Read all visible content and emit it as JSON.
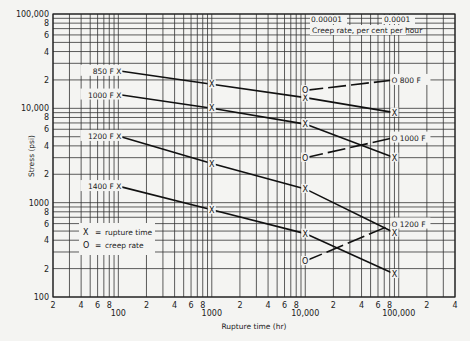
{
  "chart_data": {
    "type": "line",
    "title": "",
    "xlabel": "Rupture time (hr)",
    "ylabel": "Stress (psi)",
    "xscale": "log",
    "yscale": "log",
    "xlim": [
      20,
      400000
    ],
    "ylim": [
      100,
      100000
    ],
    "grid": true,
    "x_tick_labels": [
      {
        "value": 20,
        "label": "2"
      },
      {
        "value": 40,
        "label": "4"
      },
      {
        "value": 60,
        "label": "6"
      },
      {
        "value": 80,
        "label": "8"
      },
      {
        "value": 100,
        "label": "100",
        "major": true
      },
      {
        "value": 200,
        "label": "2"
      },
      {
        "value": 400,
        "label": "4"
      },
      {
        "value": 600,
        "label": "6"
      },
      {
        "value": 800,
        "label": "8"
      },
      {
        "value": 1000,
        "label": "1000",
        "major": true
      },
      {
        "value": 2000,
        "label": "2"
      },
      {
        "value": 4000,
        "label": "4"
      },
      {
        "value": 6000,
        "label": "6"
      },
      {
        "value": 8000,
        "label": "8"
      },
      {
        "value": 10000,
        "label": "10,000",
        "major": true
      },
      {
        "value": 20000,
        "label": "2"
      },
      {
        "value": 40000,
        "label": "4"
      },
      {
        "value": 60000,
        "label": "6"
      },
      {
        "value": 80000,
        "label": "8"
      },
      {
        "value": 100000,
        "label": "100,000",
        "major": true
      },
      {
        "value": 200000,
        "label": "2"
      },
      {
        "value": 400000,
        "label": "4"
      }
    ],
    "y_tick_labels": [
      {
        "value": 100,
        "label": "100"
      },
      {
        "value": 200,
        "label": "2"
      },
      {
        "value": 400,
        "label": "4"
      },
      {
        "value": 600,
        "label": "6"
      },
      {
        "value": 800,
        "label": "8"
      },
      {
        "value": 1000,
        "label": "1000"
      },
      {
        "value": 2000,
        "label": "2"
      },
      {
        "value": 4000,
        "label": "4"
      },
      {
        "value": 6000,
        "label": "6"
      },
      {
        "value": 8000,
        "label": "8"
      },
      {
        "value": 10000,
        "label": "10,000"
      },
      {
        "value": 20000,
        "label": "2"
      },
      {
        "value": 40000,
        "label": "4"
      },
      {
        "value": 60000,
        "label": "6"
      },
      {
        "value": 80000,
        "label": "8"
      },
      {
        "value": 100000,
        "label": "100,000"
      }
    ],
    "series": [
      {
        "name": "850 F",
        "kind": "rupture",
        "marker": "X",
        "x": [
          100,
          1000,
          10000,
          90000
        ],
        "y": [
          25000,
          18000,
          13000,
          9000
        ]
      },
      {
        "name": "1000 F",
        "kind": "rupture",
        "marker": "X",
        "x": [
          100,
          1000,
          10000,
          90000
        ],
        "y": [
          14000,
          10000,
          6800,
          3000
        ]
      },
      {
        "name": "1200 F",
        "kind": "rupture",
        "marker": "X",
        "x": [
          100,
          1000,
          10000,
          90000
        ],
        "y": [
          5100,
          2600,
          1400,
          480
        ]
      },
      {
        "name": "1400 F",
        "kind": "rupture",
        "marker": "X",
        "x": [
          100,
          1000,
          10000,
          90000
        ],
        "y": [
          1500,
          840,
          470,
          175
        ]
      },
      {
        "name": "800 F",
        "kind": "creep",
        "marker": "O",
        "creep_rate": [
          1e-05,
          0.0001
        ],
        "y": [
          15500,
          20000
        ]
      },
      {
        "name": "1000 F",
        "kind": "creep",
        "marker": "O",
        "creep_rate": [
          1e-05,
          0.0001
        ],
        "y": [
          3000,
          4900
        ]
      },
      {
        "name": "1200 F",
        "kind": "creep",
        "marker": "O",
        "creep_rate": [
          1e-05,
          0.0001
        ],
        "y": [
          240,
          600
        ]
      }
    ],
    "secondary_axis": {
      "label": "Creep rate, per cent per hour",
      "ticks": [
        {
          "label": "0.00001",
          "aligned_x": 10000
        },
        {
          "label": "0.0001",
          "aligned_x": 90000
        }
      ]
    },
    "legend": {
      "placement": "lower-left",
      "entries": [
        {
          "symbol": "X",
          "text": "rupture time"
        },
        {
          "symbol": "O",
          "text": "creep rate"
        }
      ]
    },
    "series_labels": {
      "rupture": [
        {
          "text": "850 F X",
          "series": 0
        },
        {
          "text": "1000 F X",
          "series": 1
        },
        {
          "text": "1200 F X",
          "series": 2
        },
        {
          "text": "1400 F X",
          "series": 3
        }
      ],
      "creep": [
        {
          "text": "O 800 F",
          "series": 4
        },
        {
          "text": "O 1000 F",
          "series": 5
        },
        {
          "text": "O 1200 F",
          "series": 6
        }
      ]
    }
  }
}
